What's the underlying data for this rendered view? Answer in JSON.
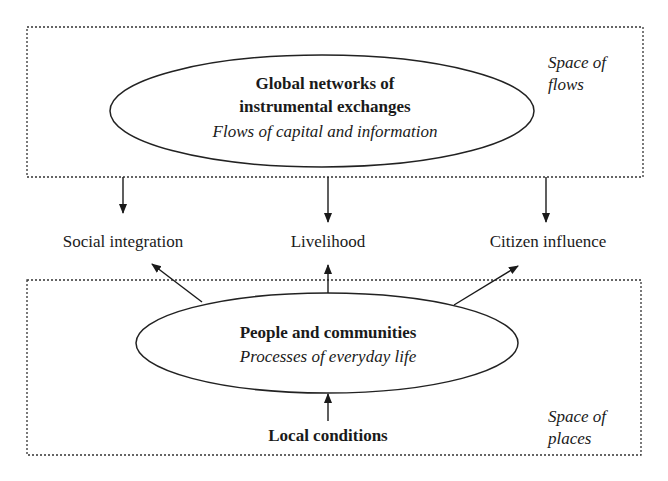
{
  "diagram": {
    "top_region": {
      "label_line1": "Space of",
      "label_line2": "flows",
      "node": {
        "title_line1": "Global networks of",
        "title_line2": "instrumental exchanges",
        "subtitle": "Flows of capital and information"
      }
    },
    "middle_outcomes": [
      {
        "label": "Social integration"
      },
      {
        "label": "Livelihood"
      },
      {
        "label": "Citizen influence"
      }
    ],
    "bottom_region": {
      "label_line1": "Space of",
      "label_line2": "places",
      "node": {
        "title": "People and communities",
        "subtitle": "Processes of everyday life"
      },
      "input": {
        "label": "Local conditions"
      }
    },
    "edges": [
      {
        "from": "Global networks of instrumental exchanges",
        "to": "Social integration"
      },
      {
        "from": "Global networks of instrumental exchanges",
        "to": "Livelihood"
      },
      {
        "from": "Global networks of instrumental exchanges",
        "to": "Citizen influence"
      },
      {
        "from": "People and communities",
        "to": "Social integration"
      },
      {
        "from": "People and communities",
        "to": "Livelihood"
      },
      {
        "from": "People and communities",
        "to": "Citizen influence"
      },
      {
        "from": "Local conditions",
        "to": "People and communities"
      }
    ]
  }
}
